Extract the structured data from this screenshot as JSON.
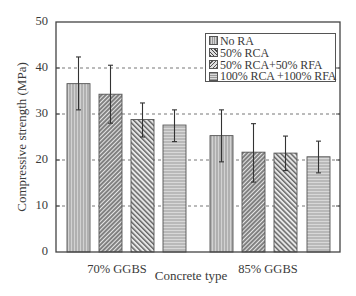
{
  "chart_data": {
    "type": "bar",
    "title": "",
    "xlabel": "Concrete type",
    "ylabel": "Compressive strength (MPa)",
    "ylim": [
      0,
      50
    ],
    "yticks": [
      0,
      10,
      20,
      30,
      40,
      50
    ],
    "grid": "horizontal dashed",
    "legend_position": "upper right (inside)",
    "categories": [
      "70% GGBS",
      "85% GGBS"
    ],
    "series": [
      {
        "name": "No RA",
        "pattern": "vertical-lines",
        "values": [
          36.6,
          25.3
        ],
        "error_low": [
          30.9,
          19.6
        ],
        "error_high": [
          42.4,
          30.9
        ]
      },
      {
        "name": "50% RCA",
        "pattern": "dense-back-diagonal",
        "values": [
          34.3,
          21.7
        ],
        "error_low": [
          28.0,
          15.2
        ],
        "error_high": [
          40.6,
          27.9
        ]
      },
      {
        "name": "50% RCA+50% RFA",
        "pattern": "diagonal",
        "values": [
          28.8,
          21.5
        ],
        "error_low": [
          25.0,
          17.7
        ],
        "error_high": [
          32.4,
          25.2
        ]
      },
      {
        "name": "100% RCA +100% RFA",
        "pattern": "horizontal-lines",
        "values": [
          27.6,
          20.7
        ],
        "error_low": [
          24.0,
          17.2
        ],
        "error_high": [
          30.9,
          24.1
        ]
      }
    ]
  },
  "legend": {
    "items": [
      {
        "label": "No RA"
      },
      {
        "label": "50% RCA"
      },
      {
        "label": "50% RCA+50% RFA"
      },
      {
        "label": "100% RCA +100% RFA"
      }
    ]
  },
  "axis": {
    "y_title": "Compressive strength (MPa)",
    "x_title": "Concrete type",
    "y_ticks": [
      "0",
      "10",
      "20",
      "30",
      "40",
      "50"
    ],
    "x_categories": [
      "70% GGBS",
      "85% GGBS"
    ]
  }
}
